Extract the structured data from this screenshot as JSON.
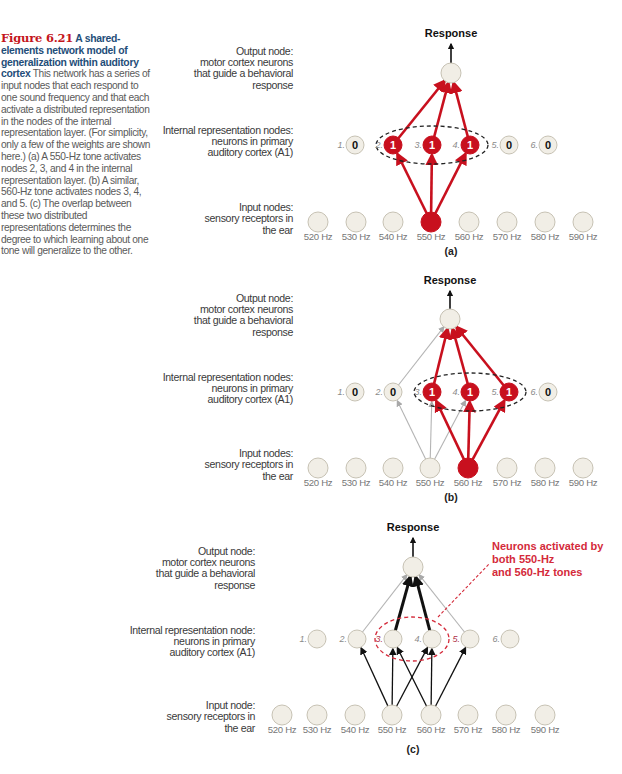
{
  "caption": {
    "figure_number": "Figure 6.21",
    "title": " A shared-elements network model of generalization within auditory cortex",
    "body": "  This network has a series of input nodes that each respond to one sound frequency and that each activate a distributed representation in the nodes of the internal representation layer. (For simplicity, only a few of the weights are shown here.) (a) A 550-Hz tone activates nodes 2, 3, and 4 in the internal representation layer. (b) A similar, 560-Hz tone activates nodes 3, 4, and 5. (c) The overlap between these two distributed representations determines the degree to which learning about one tone will generalize to the other."
  },
  "colors": {
    "active_red": "#c8101e",
    "node_fill": "#f1eee6",
    "node_stroke": "#c7c2b4",
    "weak_gray": "#b4b4b4",
    "strong_black": "#111111",
    "annotation_red": "#d42a3a"
  },
  "frequencies": [
    "520 Hz",
    "530 Hz",
    "540 Hz",
    "550 Hz",
    "560 Hz",
    "570 Hz",
    "580 Hz",
    "590 Hz"
  ],
  "panels": [
    {
      "id": "a",
      "panel_label": "(a)",
      "response_label": "Response",
      "labels": {
        "output": [
          "Output node:",
          "motor cortex neurons",
          "that guide a behavioral",
          "response"
        ],
        "internal": [
          "Internal representation nodes:",
          "neurons in primary",
          "auditory cortex (A1)"
        ],
        "input": [
          "Input nodes:",
          "sensory receptors in",
          "the ear"
        ]
      },
      "internal_values": [
        "0",
        "1",
        "1",
        "1",
        "0",
        "0"
      ],
      "active_input": "550 Hz",
      "active_internal_nodes": [
        2,
        3,
        4
      ]
    },
    {
      "id": "b",
      "panel_label": "(b)",
      "response_label": "Response",
      "labels": {
        "output": [
          "Output node:",
          "motor cortex neurons",
          "that guide a behavioral",
          "response"
        ],
        "internal": [
          "Internal representation nodes:",
          "neurons in primary",
          "auditory cortex (A1)"
        ],
        "input": [
          "Input nodes:",
          "sensory receptors in",
          "the ear"
        ]
      },
      "internal_values": [
        "0",
        "0",
        "1",
        "1",
        "1",
        "0"
      ],
      "active_input": "560 Hz",
      "active_internal_nodes": [
        3,
        4,
        5
      ]
    },
    {
      "id": "c",
      "panel_label": "(c)",
      "response_label": "Response",
      "labels": {
        "output": [
          "Output node:",
          "motor cortex neurons",
          "that guide a behavioral",
          "response"
        ],
        "internal": [
          "Internal representation node:",
          "neurons in primary",
          "auditory cortex (A1)"
        ],
        "input": [
          "Input node:",
          "sensory receptors in",
          "the ear"
        ]
      },
      "internal_values": [
        "",
        "",
        "",
        "",
        "",
        ""
      ],
      "overlap_nodes": [
        3,
        4
      ],
      "annotation": [
        "Neurons activated by",
        "both 550-Hz",
        "and 560-Hz tones"
      ]
    }
  ],
  "node_indices": [
    "1.",
    "2.",
    "3.",
    "4.",
    "5.",
    "6."
  ]
}
